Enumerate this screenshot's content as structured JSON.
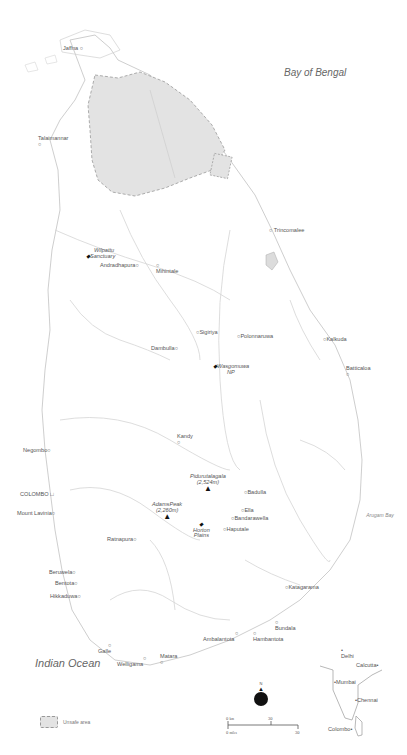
{
  "seas": {
    "bay_of_bengal": "Bay of Bengal",
    "indian_ocean": "Indian Ocean",
    "arugam_bay": "Arugam Bay"
  },
  "cities": [
    {
      "id": "jaffna",
      "label": "Jaffna"
    },
    {
      "id": "talaimannar",
      "label": "Talaimannar"
    },
    {
      "id": "trincomalee",
      "label": "Trincomalee"
    },
    {
      "id": "andradhapura",
      "label": "Andradhapura"
    },
    {
      "id": "mihintale",
      "label": "Mihintale"
    },
    {
      "id": "sigiriya",
      "label": "Sigiriya"
    },
    {
      "id": "polonnaruwa",
      "label": "Polonnaruwa"
    },
    {
      "id": "kalkuda",
      "label": "Kalkuda"
    },
    {
      "id": "dambulla",
      "label": "Dambulla"
    },
    {
      "id": "batticaloa",
      "label": "Batticaloa"
    },
    {
      "id": "kandy",
      "label": "Kandy"
    },
    {
      "id": "negombo",
      "label": "Negombo"
    },
    {
      "id": "colombo",
      "label": "COLOMBO"
    },
    {
      "id": "mount-lavinia",
      "label": "Mount Lavinia"
    },
    {
      "id": "badulla",
      "label": "Badulla"
    },
    {
      "id": "ella",
      "label": "Ella"
    },
    {
      "id": "bandarawella",
      "label": "Bandarawella"
    },
    {
      "id": "haputale",
      "label": "Haputale"
    },
    {
      "id": "ratnapura",
      "label": "Ratnapura"
    },
    {
      "id": "beruwela",
      "label": "Beruwela"
    },
    {
      "id": "bentota",
      "label": "Bentota"
    },
    {
      "id": "hikkaduwa",
      "label": "Hikkaduwa"
    },
    {
      "id": "katagarama",
      "label": "Katagarama"
    },
    {
      "id": "bundala",
      "label": "Bundala"
    },
    {
      "id": "ambalantota",
      "label": "Ambalantota"
    },
    {
      "id": "hambantota",
      "label": "Hambantota"
    },
    {
      "id": "galle",
      "label": "Galle"
    },
    {
      "id": "welligama",
      "label": "Welligama"
    },
    {
      "id": "matara",
      "label": "Matara"
    }
  ],
  "parks": [
    {
      "id": "wilpattu",
      "line1": "Wilpattu",
      "line2": "Sanctuary"
    },
    {
      "id": "wasgomuwa",
      "line1": "Wasgomuwa",
      "line2": "NP"
    },
    {
      "id": "horton",
      "line1": "Horton",
      "line2": "Plains"
    }
  ],
  "peaks": [
    {
      "id": "pidurutalagala",
      "name": "Pidurutalagala",
      "height": "(2,524m)"
    },
    {
      "id": "adams-peak",
      "name": "AdamsPeak",
      "height": "(2,260m)"
    }
  ],
  "legend": {
    "unsafe_area": "Unsafe area"
  },
  "compass": {
    "north": "N"
  },
  "scale": {
    "km_zero": "0",
    "km_unit": "km",
    "km_value": "30",
    "miles_zero": "0",
    "miles_unit": "miles",
    "miles_value": "30"
  },
  "inset": {
    "cities": [
      {
        "id": "delhi",
        "label": "Delhi"
      },
      {
        "id": "calcutta",
        "label": "Calcutta"
      },
      {
        "id": "mumbai",
        "label": "Mumbai"
      },
      {
        "id": "chennai",
        "label": "Chennai"
      },
      {
        "id": "colombo",
        "label": "Colombo"
      }
    ]
  },
  "colors": {
    "unsafe_fill": "#e3e3e3",
    "outline": "#bdbdbd",
    "river": "#cfcfcf",
    "marker": "#111111"
  }
}
